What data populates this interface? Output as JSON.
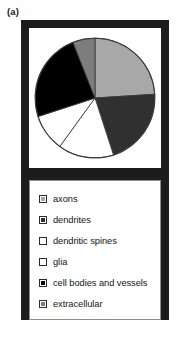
{
  "figure": {
    "panel_label": "(a)",
    "frame_color": "#1c1c1c",
    "background_color": "#ffffff"
  },
  "legend": {
    "border_color": "#8e8e8e",
    "items": [
      {
        "label": "axons",
        "color": "#a8a8a8"
      },
      {
        "label": "dendrites",
        "color": "#303030"
      },
      {
        "label": "dendritic spines",
        "color": "#ffffff"
      },
      {
        "label": "glia",
        "color": "#ffffff"
      },
      {
        "label": "cell bodies and vessels",
        "color": "#000000"
      },
      {
        "label": "extracellular",
        "color": "#7d7d7d"
      }
    ]
  },
  "chart_data": {
    "type": "pie",
    "title": "",
    "xlabel": "",
    "ylabel": "",
    "legend_position": "below",
    "grid": false,
    "start_angle_deg": 0,
    "direction": "clockwise",
    "outline_color": "#3a3a3a",
    "categories": [
      "axons",
      "dendrites",
      "dendritic spines",
      "glia",
      "cell bodies and vessels",
      "extracellular"
    ],
    "values": [
      24,
      21,
      15,
      10,
      24,
      6
    ],
    "units": "percent",
    "angles_deg": [
      86.4,
      75.6,
      54.0,
      36.0,
      86.4,
      21.6
    ],
    "colors": [
      "#a8a8a8",
      "#303030",
      "#ffffff",
      "#ffffff",
      "#000000",
      "#7d7d7d"
    ]
  }
}
